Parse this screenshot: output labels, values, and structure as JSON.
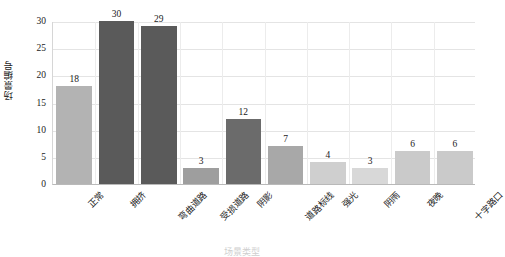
{
  "chart_data": {
    "type": "bar",
    "title": "",
    "xlabel": "场景类型",
    "ylabel": "场景编号",
    "categories": [
      "正常",
      "拥挤",
      "弯曲道路",
      "受损道路",
      "阴影",
      "道路标线",
      "强光",
      "阴雨",
      "夜晚",
      "十字路口"
    ],
    "values": [
      18,
      30,
      29,
      3,
      12,
      7,
      4,
      3,
      6,
      6
    ],
    "ylim": [
      0,
      30
    ],
    "yticks": [
      0,
      5,
      10,
      15,
      20,
      25,
      30
    ],
    "ytick_labels": [
      "0",
      "5",
      "10",
      "15",
      "20",
      "25",
      "30"
    ],
    "grid": "horizontal-and-vertical",
    "legend": "none",
    "bar_colors": [
      "#b3b3b3",
      "#5a5a5a",
      "#5a5a5a",
      "#9e9e9e",
      "#6b6b6b",
      "#a8a8a8",
      "#cfcfcf",
      "#d8d8d8",
      "#cacaca",
      "#cacaca"
    ],
    "value_labels": [
      "18",
      "30",
      "29",
      "3",
      "12",
      "7",
      "4",
      "3",
      "6",
      "6"
    ]
  },
  "colors": {
    "background": "#ffffff",
    "grid": "#e4e4e4",
    "axis": "#b9b9b9",
    "text": "#1b1b1b"
  }
}
